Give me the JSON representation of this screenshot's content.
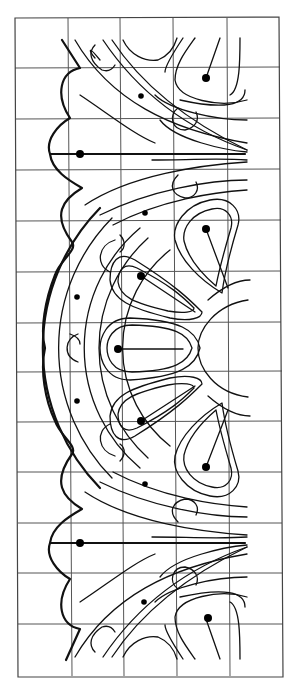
{
  "figure": {
    "grid": {
      "columns": 5,
      "rows": 13,
      "x_lines": [
        15,
        68,
        120,
        173,
        227,
        280
      ],
      "y_lines": [
        18,
        68,
        119,
        170,
        221,
        272,
        323,
        372,
        422,
        472,
        523,
        573,
        624,
        676
      ]
    },
    "colors": {
      "background": "#ffffff",
      "grid": "#555555",
      "ink": "#111111"
    },
    "rosette": {
      "center": [
        245,
        348
      ],
      "hub_radius": 47,
      "petals": 5,
      "petal_dots": [
        [
          206,
          229
        ],
        [
          141,
          276
        ],
        [
          118,
          349
        ],
        [
          141,
          421
        ],
        [
          206,
          467
        ]
      ]
    },
    "ring_dots": [
      [
        77,
        297
      ],
      [
        77,
        401
      ],
      [
        145,
        213
      ],
      [
        145,
        484
      ]
    ],
    "acanthus_dots": [
      [
        80,
        154
      ],
      [
        80,
        543
      ],
      [
        141,
        96
      ],
      [
        144,
        602
      ],
      [
        206,
        78
      ],
      [
        208,
        618
      ]
    ]
  }
}
